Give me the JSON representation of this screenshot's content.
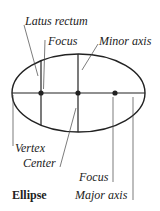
{
  "diagram": {
    "title": "Ellipse",
    "labels": {
      "latus_rectum": "Latus rectum",
      "focus_top": "Focus",
      "minor_axis": "Minor axis",
      "vertex": "Vertex",
      "center": "Center",
      "focus_bottom": "Focus",
      "major_axis": "Major axis"
    },
    "colors": {
      "stroke": "#222222",
      "background": "#ffffff"
    }
  }
}
